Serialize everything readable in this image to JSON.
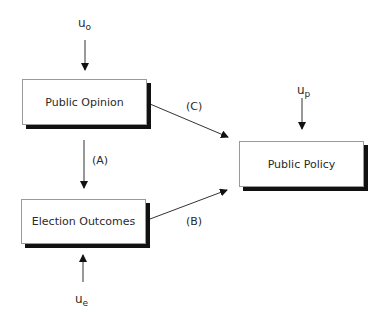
{
  "diagram": {
    "nodes": [
      {
        "id": "public_opinion",
        "label": "Public Opinion"
      },
      {
        "id": "election_outcomes",
        "label": "Election Outcomes"
      },
      {
        "id": "public_policy",
        "label": "Public Policy"
      }
    ],
    "error_terms": [
      {
        "id": "u_o",
        "base": "u",
        "sub": "o",
        "target": "public_opinion"
      },
      {
        "id": "u_e",
        "base": "u",
        "sub": "e",
        "target": "election_outcomes"
      },
      {
        "id": "u_p",
        "base": "u",
        "sub": "p",
        "target": "public_policy"
      }
    ],
    "edges": [
      {
        "label": "(A)",
        "from": "public_opinion",
        "to": "election_outcomes"
      },
      {
        "label": "(B)",
        "from": "election_outcomes",
        "to": "public_policy"
      },
      {
        "label": "(C)",
        "from": "public_opinion",
        "to": "public_policy"
      }
    ]
  }
}
